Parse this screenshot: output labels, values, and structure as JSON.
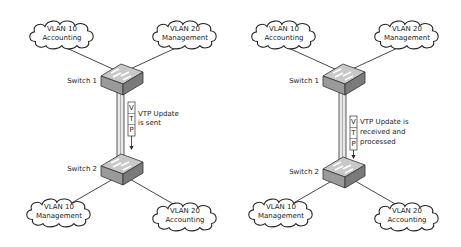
{
  "diagrams": [
    {
      "switch_top": "Switch 1",
      "switch_bottom": "Switch 2",
      "top_left_cloud": {
        "line1": "VLAN 10",
        "line2": "Accounting"
      },
      "top_right_cloud": {
        "line1": "VLAN 20",
        "line2": "Management"
      },
      "bottom_left_cloud": {
        "line1": "VLAN 10",
        "line2": "Management"
      },
      "bottom_right_cloud": {
        "line1": "VLAN 20",
        "line2": "Accounting"
      },
      "vtp_letters": [
        "V",
        "T",
        "P"
      ],
      "vtp_text": [
        "VTP Update",
        "is sent"
      ]
    },
    {
      "switch_top": "Switch 1",
      "switch_bottom": "Switch 2",
      "top_left_cloud": {
        "line1": "VLAN 10",
        "line2": "Accounting"
      },
      "top_right_cloud": {
        "line1": "VLAN 20",
        "line2": "Management"
      },
      "bottom_left_cloud": {
        "line1": "VLAN 10",
        "line2": "Management"
      },
      "bottom_right_cloud": {
        "line1": "VLAN 20",
        "line2": "Accounting"
      },
      "vtp_letters": [
        "V",
        "T",
        "P"
      ],
      "vtp_text": [
        "VTP Update is",
        "received and",
        "processed"
      ]
    }
  ]
}
